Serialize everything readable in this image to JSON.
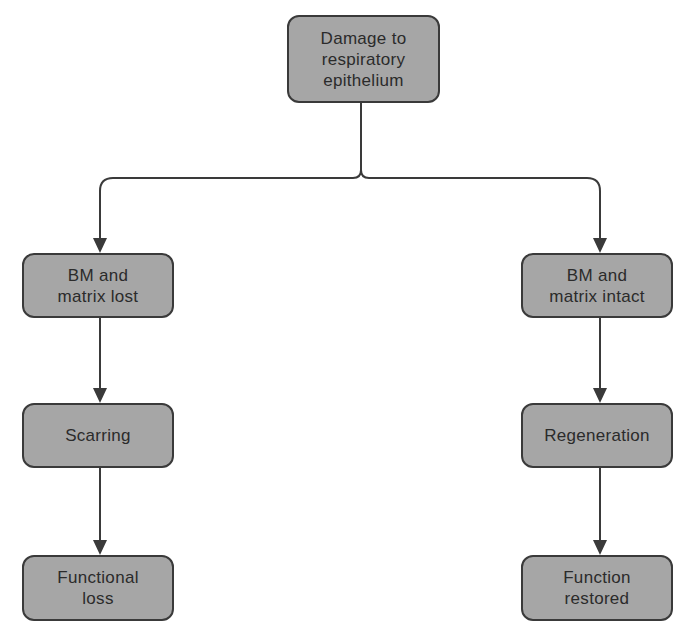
{
  "diagram": {
    "type": "flowchart",
    "colors": {
      "node_fill": "#a6a6a6",
      "node_border": "#3a3a3a",
      "edge": "#3a3a3a",
      "text": "#2b2b2b",
      "background": "#ffffff"
    },
    "nodes": {
      "root": {
        "label": "Damage to\nrespiratory\nepithelium"
      },
      "left_1": {
        "label": "BM and\nmatrix lost"
      },
      "left_2": {
        "label": "Scarring"
      },
      "left_3": {
        "label": "Functional\nloss"
      },
      "right_1": {
        "label": "BM and\nmatrix intact"
      },
      "right_2": {
        "label": "Regeneration"
      },
      "right_3": {
        "label": "Function\nrestored"
      }
    },
    "edges": [
      {
        "from": "root",
        "to": "left_1"
      },
      {
        "from": "root",
        "to": "right_1"
      },
      {
        "from": "left_1",
        "to": "left_2"
      },
      {
        "from": "left_2",
        "to": "left_3"
      },
      {
        "from": "right_1",
        "to": "right_2"
      },
      {
        "from": "right_2",
        "to": "right_3"
      }
    ]
  }
}
